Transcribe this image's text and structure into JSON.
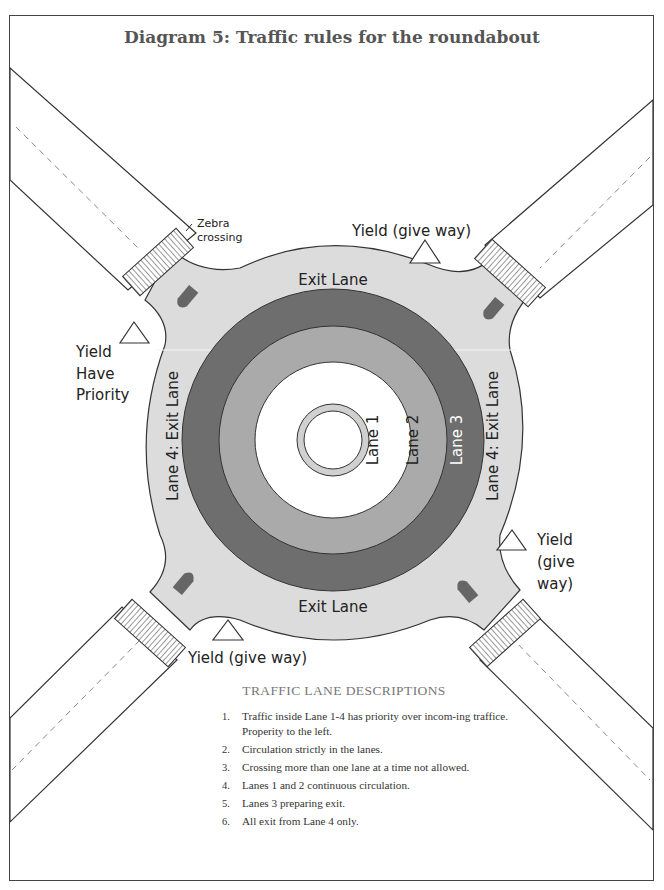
{
  "title": "Diagram 5: Traffic rules for the roundabout",
  "labels": {
    "zebra_line1": "Zebra",
    "zebra_line2": "crossing",
    "yield_top": "Yield (give way)",
    "yield_left_1": "Yield",
    "yield_left_2": "Have",
    "yield_left_3": "Priority",
    "yield_right_1": "Yield",
    "yield_right_2": "(give",
    "yield_right_3": "way)",
    "yield_bottom": "Yield (give way)",
    "exit_lane_top": "Exit Lane",
    "exit_lane_bottom": "Exit Lane",
    "lane4_left": "Lane 4: Exit Lane",
    "lane4_right": "Lane 4: Exit Lane",
    "lane1": "Lane 1",
    "lane2": "Lane 2",
    "lane3": "Lane 3"
  },
  "colors": {
    "outer_area": "#dcdcdc",
    "lane3": "#6e6e6e",
    "lane2": "#aaaaaa",
    "lane1": "#ffffff",
    "island_ring": "#d0d0d0",
    "island_marker": "#666666"
  },
  "descriptions": {
    "heading": "TRAFFIC LANE DESCRIPTIONS",
    "items": [
      {
        "num": "1.",
        "text": "Traffic inside Lane 1-4 has priority over incom-ing traffice. Properity to the left."
      },
      {
        "num": "2.",
        "text": "Circulation strictly in the lanes."
      },
      {
        "num": "3.",
        "text": "Crossing more than one lane at a time not allowed."
      },
      {
        "num": "4.",
        "text": "Lanes 1 and 2 continuous circulation."
      },
      {
        "num": "5.",
        "text": "Lanes 3 preparing exit."
      },
      {
        "num": "6.",
        "text": "All exit from Lane 4 only."
      }
    ]
  }
}
